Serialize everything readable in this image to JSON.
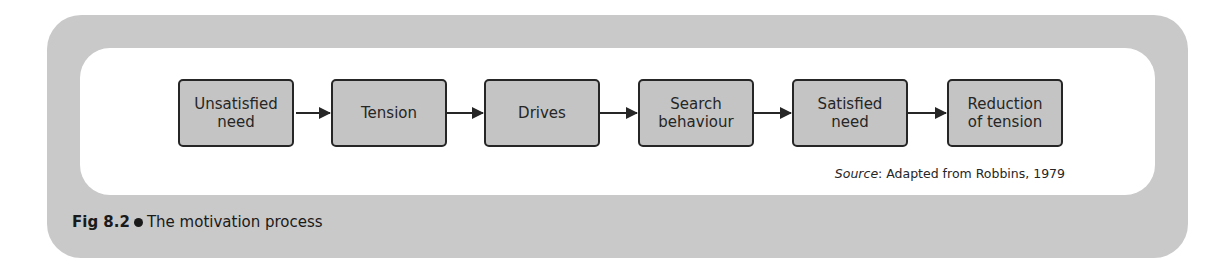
{
  "figure": {
    "number_label": "Fig 8.2",
    "title": "The motivation process",
    "source_label": "Source",
    "source_text": ": Adapted from Robbins, 1979"
  },
  "flow": {
    "steps": [
      {
        "label": "Unsatisfied\nneed"
      },
      {
        "label": "Tension"
      },
      {
        "label": "Drives"
      },
      {
        "label": "Search\nbehaviour"
      },
      {
        "label": "Satisfied\nneed"
      },
      {
        "label": "Reduction\nof tension"
      }
    ]
  },
  "colors": {
    "panel": "#c9c9c9",
    "box_fill": "#c4c4c4",
    "stroke": "#262626"
  }
}
